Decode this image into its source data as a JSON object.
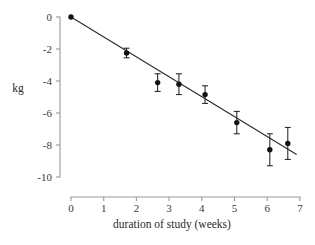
{
  "chart_data": {
    "type": "scatter",
    "title": "",
    "xlabel": "duration of study (weeks)",
    "ylabel": "kg",
    "xlim": [
      0,
      7
    ],
    "ylim": [
      -10,
      0
    ],
    "xticks": [
      0,
      1,
      2,
      3,
      4,
      5,
      6,
      7
    ],
    "xtick_labels": [
      "0",
      "1",
      "2",
      "3",
      "4",
      "5",
      "6",
      "7"
    ],
    "yticks": [
      0,
      -2,
      -4,
      -6,
      -8,
      -10
    ],
    "ytick_labels": [
      "0",
      "-2",
      "-4",
      "-6",
      "-8",
      "-10"
    ],
    "grid": false,
    "legend": null,
    "series": [
      {
        "name": "mean weight change",
        "marker": "filled-circle",
        "color": "#111111",
        "x": [
          0.0,
          1.7,
          2.65,
          3.3,
          4.1,
          5.07,
          6.08,
          6.63
        ],
        "y": [
          0.0,
          -2.25,
          -4.1,
          -4.2,
          -4.85,
          -6.6,
          -8.3,
          -7.9
        ],
        "yerr": [
          0.0,
          0.3,
          0.55,
          0.65,
          0.55,
          0.7,
          1.0,
          1.0
        ]
      },
      {
        "name": "fitted regression line",
        "type": "line",
        "color": "#2c2c2c",
        "x": [
          0.0,
          6.9
        ],
        "y": [
          0.0,
          -8.6
        ]
      }
    ]
  },
  "axes": {
    "x_title": "duration of study (weeks)",
    "y_title": "kg"
  }
}
